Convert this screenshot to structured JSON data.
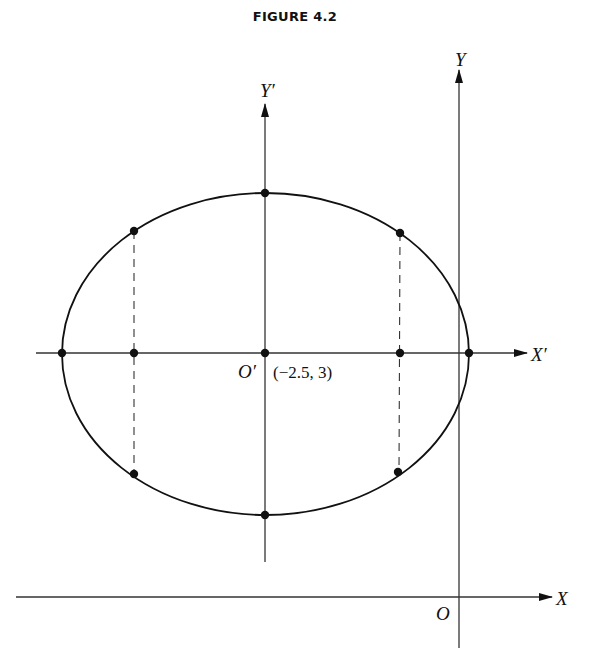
{
  "figure": {
    "title": "FIGURE 4.2"
  },
  "labels": {
    "x_axis": "X",
    "y_axis": "Y",
    "x_prime_axis": "X′",
    "y_prime_axis": "Y′",
    "origin": "O",
    "new_origin": "O′",
    "new_origin_coords": "(−2.5, 3)"
  },
  "colors": {
    "ink": "#111111",
    "axis": "#333333",
    "background": "#ffffff"
  },
  "ellipse": {
    "center_label": "O′",
    "center_coords": "(−2.5, 3)",
    "marked_points": 11
  }
}
